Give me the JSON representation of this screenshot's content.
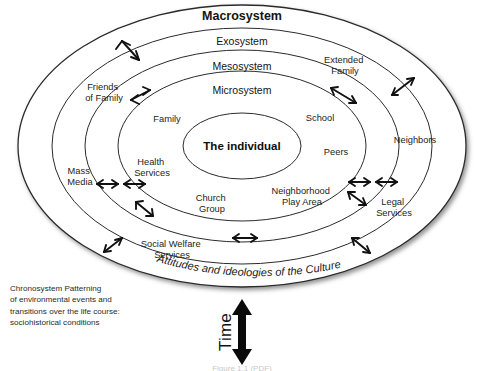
{
  "figure": {
    "background_color": "#ffffff",
    "line_color": "#2b2b2b",
    "text_color": "#232323",
    "caption": "Figure 1.1 (PDF)"
  },
  "systems": [
    {
      "id": "macrosystem",
      "label": "Macrosystem",
      "order": 1
    },
    {
      "id": "exosystem",
      "label": "Exosystem",
      "order": 2
    },
    {
      "id": "mesosystem",
      "label": "Mesosystem",
      "order": 3
    },
    {
      "id": "microsystem",
      "label": "Microsystem",
      "order": 4
    }
  ],
  "core": {
    "label": "The individual"
  },
  "microsystem_nodes": [
    {
      "id": "family",
      "label": "Family"
    },
    {
      "id": "school",
      "label": "School"
    },
    {
      "id": "peers",
      "label": "Peers"
    },
    {
      "id": "health",
      "label_line1": "Health",
      "label_line2": "Services"
    },
    {
      "id": "church",
      "label_line1": "Church",
      "label_line2": "Group"
    },
    {
      "id": "playarea",
      "label_line1": "Neighborhood",
      "label_line2": "Play Area"
    }
  ],
  "mesosystem_nodes": [
    {
      "id": "social_welfare",
      "label_line1": "Social Welfare",
      "label_line2": "Services"
    }
  ],
  "exosystem_nodes": [
    {
      "id": "friends_family",
      "label_line1": "Friends",
      "label_line2": "of Family"
    },
    {
      "id": "extended_family",
      "label_line1": "Extended",
      "label_line2": "Family"
    },
    {
      "id": "mass_media",
      "label_line1": "Mass",
      "label_line2": "Media"
    },
    {
      "id": "neighbors",
      "label": "Neighbors"
    },
    {
      "id": "legal_services",
      "label_line1": "Legal",
      "label_line2": "Services"
    }
  ],
  "macrosystem": {
    "curved_text": "Attitudes and ideologies of the Culture"
  },
  "chronosystem": {
    "lines": [
      "Chronosystem Patterning",
      "of environmental events and",
      "transitions over the life course:",
      "sociohistorical conditions"
    ]
  },
  "time_axis": {
    "label": "Time",
    "arrow": "double-headed-vertical-arrow"
  }
}
